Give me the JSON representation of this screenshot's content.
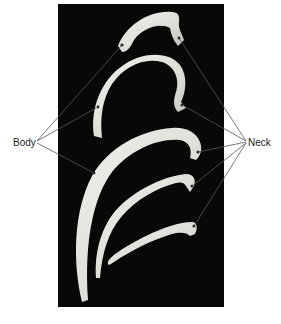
{
  "figure": {
    "background_color": "#ffffff",
    "panel_color": "#080808",
    "bone_color": "#e6e6e2",
    "leader_color": "#555555",
    "labels": {
      "left": "Body",
      "right": "Neck"
    },
    "rib_count": 5
  }
}
